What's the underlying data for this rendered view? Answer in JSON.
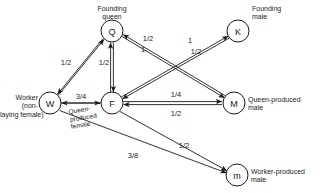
{
  "figure": {
    "background_color": "#ffffff",
    "line_color": "#1a1a1a"
  },
  "nodes": [
    {
      "id": "Q",
      "glyph": "Q",
      "caption": "Founding\nqueen",
      "caption_align": "center",
      "cx": 112,
      "cy": 31,
      "r": 11
    },
    {
      "id": "K",
      "glyph": "K",
      "caption": "Founding\nmale",
      "caption_align": "left",
      "cx": 238,
      "cy": 31,
      "r": 11
    },
    {
      "id": "W",
      "glyph": "W",
      "caption": "Worker\n(non-\nlaying female)",
      "caption_align": "right",
      "cx": 50,
      "cy": 103,
      "r": 11
    },
    {
      "id": "F",
      "glyph": "F",
      "caption": "Queen-\nproduced\nfemale",
      "caption_align": "center",
      "cx": 112,
      "cy": 103,
      "r": 11
    },
    {
      "id": "M",
      "glyph": "M",
      "caption": "Queen-produced\nmale",
      "caption_align": "left",
      "cx": 234,
      "cy": 103,
      "r": 11
    },
    {
      "id": "m",
      "glyph": "m",
      "caption": "Worker-produced\nmale",
      "caption_align": "left",
      "cx": 237,
      "cy": 175,
      "r": 11
    }
  ],
  "edges": [
    {
      "from": "W",
      "to": "Q",
      "weight": "1/2"
    },
    {
      "from": "Q",
      "to": "W",
      "weight": "1/2"
    },
    {
      "from": "F",
      "to": "Q",
      "weight": "1/2"
    },
    {
      "from": "Q",
      "to": "F",
      "weight": "1/2"
    },
    {
      "from": "Q",
      "to": "M",
      "weight": "1/2"
    },
    {
      "from": "M",
      "to": "Q",
      "weight": "1"
    },
    {
      "from": "F",
      "to": "K",
      "weight": "1"
    },
    {
      "from": "K",
      "to": "F",
      "weight": "1/2"
    },
    {
      "from": "W",
      "to": "F",
      "weight": "3/4"
    },
    {
      "from": "F",
      "to": "M",
      "weight": "1/4"
    },
    {
      "from": "M",
      "to": "F",
      "weight": "1/2"
    },
    {
      "from": "F",
      "to": "m",
      "weight": "1/2"
    },
    {
      "from": "W",
      "to": "m",
      "weight": "3/8"
    }
  ],
  "weight_labels": {
    "w_q": "1/2",
    "f_q": "1/2",
    "q_m_upper": "1/2",
    "q_m_lower": "1",
    "f_k_upper": "1",
    "f_k_lower": "1/2",
    "w_f": "3/4",
    "f_m_upper": "1/4",
    "f_m_lower": "1/2",
    "f_m_small": "1/2",
    "w_m_small": "3/8"
  },
  "captions": {
    "founding_queen": "Founding\nqueen",
    "founding_male": "Founding\nmale",
    "worker": "Worker\n(non-\nlaying female)",
    "queen_produced_female": "Queen-\nproduced\nfemale",
    "queen_produced_male": "Queen-produced\nmale",
    "worker_produced_male": "Worker-produced\nmale"
  },
  "glyphs": {
    "q": "Q",
    "k": "K",
    "w": "W",
    "f": "F",
    "m_upper": "M",
    "m_lower": "m"
  }
}
